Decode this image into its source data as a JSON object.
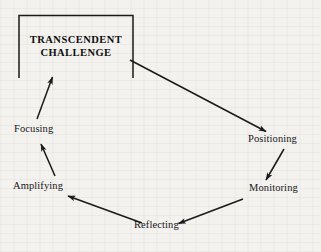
{
  "diagram": {
    "type": "cycle-diagram",
    "title_box": {
      "line1": "TRANSCENDENT",
      "line2": "CHALLENGE",
      "shape": "open-bottom-rectangle",
      "stroke_color": "#1a1a1a"
    },
    "nodes": [
      {
        "id": "positioning",
        "label": "Positioning"
      },
      {
        "id": "monitoring",
        "label": "Monitoring"
      },
      {
        "id": "reflecting",
        "label": "Reflecting"
      },
      {
        "id": "amplifying",
        "label": "Amplifying"
      },
      {
        "id": "focusing",
        "label": "Focusing"
      }
    ],
    "edges": [
      {
        "from": "transcendent-challenge",
        "to": "positioning"
      },
      {
        "from": "positioning",
        "to": "monitoring"
      },
      {
        "from": "monitoring",
        "to": "reflecting"
      },
      {
        "from": "reflecting",
        "to": "amplifying"
      },
      {
        "from": "amplifying",
        "to": "focusing"
      },
      {
        "from": "focusing",
        "to": "transcendent-challenge"
      }
    ],
    "colors": {
      "ink": "#1a1a1a",
      "background": "#f4f2ee"
    }
  }
}
